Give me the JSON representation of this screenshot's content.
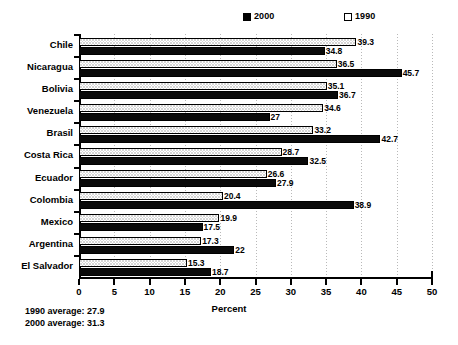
{
  "chart_data": {
    "type": "bar",
    "orientation": "horizontal",
    "title": "",
    "xlabel": "Percent",
    "ylabel": "",
    "xlim": [
      0,
      50
    ],
    "xticks": [
      0,
      5,
      10,
      15,
      20,
      25,
      30,
      35,
      40,
      45,
      50
    ],
    "grid": true,
    "grid_axis": "x",
    "legend_position": "top",
    "categories": [
      "Chile",
      "Nicaragua",
      "Bolivia",
      "Venezuela",
      "Brasil",
      "Costa Rica",
      "Ecuador",
      "Colombia",
      "Mexico",
      "Argentina",
      "El Salvador"
    ],
    "series": [
      {
        "name": "1990",
        "color": "#d9d9d9",
        "pattern": "dotted",
        "values": [
          39.3,
          36.5,
          35.1,
          34.6,
          33.2,
          28.7,
          26.6,
          20.4,
          19.9,
          17.3,
          15.3
        ]
      },
      {
        "name": "2000",
        "color": "#0a0a0a",
        "pattern": "solid",
        "values": [
          34.8,
          45.7,
          36.7,
          27,
          42.7,
          32.5,
          27.9,
          38.9,
          17.5,
          22,
          18.7
        ]
      }
    ],
    "annotations": [
      "1990 average: 27.9",
      "2000 average: 31.3"
    ]
  },
  "legend": {
    "entries": [
      {
        "label": "2000",
        "swatch": "solid"
      },
      {
        "label": "1990",
        "swatch": "hatch"
      }
    ]
  },
  "footnotes": {
    "line1": "1990 average: 27.9",
    "line2": "2000 average: 31.3"
  }
}
